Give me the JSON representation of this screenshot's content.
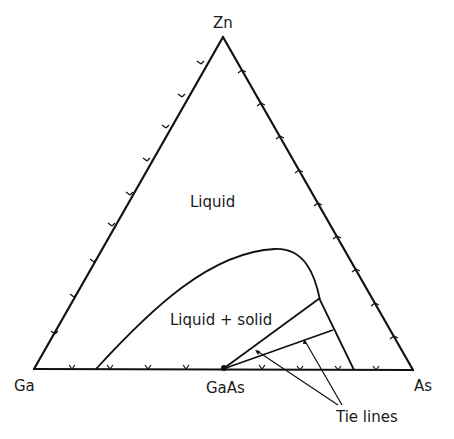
{
  "diagram": {
    "type": "ternary-phase-diagram",
    "vertices": {
      "top": "Zn",
      "bottom_left": "Ga",
      "bottom_right": "As"
    },
    "compound": "GaAs",
    "regions": {
      "upper": "Liquid",
      "lower": "Liquid + solid"
    },
    "annotation": "Tie lines",
    "ticks_per_side": 9
  },
  "colors": {
    "line": "#111111",
    "text": "#1a1a1a",
    "background": "#ffffff"
  }
}
